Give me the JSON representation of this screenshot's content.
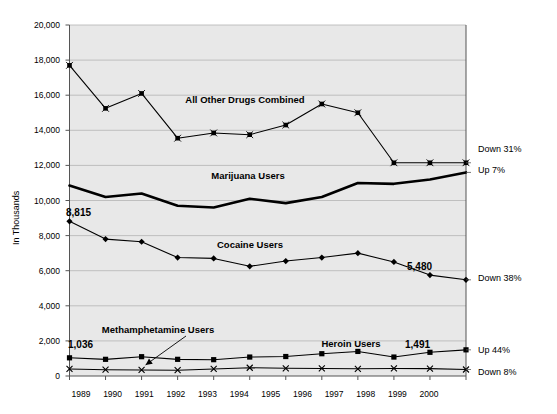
{
  "chart_data": {
    "type": "line",
    "title": "",
    "xlabel": "",
    "ylabel": "In Thousands",
    "grid": true,
    "legend_position": "inline-annotations",
    "categories": [
      "1989",
      "1990",
      "1991",
      "1992",
      "1993",
      "1994",
      "1995",
      "1996",
      "1997",
      "1998",
      "1999",
      "2000"
    ],
    "x": [
      1989,
      1990,
      1991,
      1992,
      1993,
      1994,
      1995,
      1996,
      1997,
      1998,
      1999,
      2000
    ],
    "ylim": [
      0,
      20000
    ],
    "xlim": [
      1989,
      2000
    ],
    "yticks": [
      "0",
      "2,000",
      "4,000",
      "6,000",
      "8,000",
      "10,000",
      "12,000",
      "14,000",
      "16,000",
      "18,000",
      "20,000"
    ],
    "ytick_values": [
      0,
      2000,
      4000,
      6000,
      8000,
      10000,
      12000,
      14000,
      16000,
      18000,
      20000
    ],
    "series": [
      {
        "name": "All Other Drugs Combined",
        "marker": "x-square",
        "values": [
          17700,
          15250,
          16100,
          13550,
          13850,
          13750,
          14300,
          15500,
          15000,
          12150,
          12150,
          12150
        ],
        "end_note": "Down 31%"
      },
      {
        "name": "Marijuana Users",
        "marker": "none",
        "values": [
          10850,
          10200,
          10400,
          9700,
          9600,
          10100,
          9850,
          10200,
          11000,
          10950,
          11200,
          11600
        ],
        "end_note": "Up 7%"
      },
      {
        "name": "Cocaine Users",
        "marker": "diamond",
        "values": [
          8815,
          7800,
          7650,
          6750,
          6700,
          6250,
          6550,
          6750,
          7000,
          6500,
          5750,
          5480
        ],
        "start_label": "8,815",
        "end_label": "5,480",
        "end_note": "Down 38%"
      },
      {
        "name": "Heroin Users",
        "marker": "square",
        "values": [
          1036,
          950,
          1100,
          950,
          930,
          1080,
          1110,
          1270,
          1400,
          1080,
          1350,
          1491
        ],
        "start_label": "1,036",
        "end_label": "1,491",
        "end_note": "Up 44%"
      },
      {
        "name": "Methamphetamine Users",
        "marker": "x",
        "values": [
          400,
          360,
          345,
          330,
          400,
          470,
          440,
          430,
          410,
          430,
          420,
          370
        ],
        "end_note": "Down 8%"
      }
    ],
    "annotations": [
      {
        "text": "All Other Drugs Combined",
        "x": 1993.3,
        "y": 15050
      },
      {
        "text": "Marijuana Users",
        "x": 1993.4,
        "y": 11630
      },
      {
        "text": "Cocaine Users",
        "x": 1994.1,
        "y": 7480
      },
      {
        "text": "Methamphetamine Users",
        "x": 1991.4,
        "y": 2620
      },
      {
        "text": "Heroin Users",
        "x": 1996.4,
        "y": 1800
      }
    ],
    "colors": {
      "plot_background": "#e8e8e8",
      "gridline": "#b4b4b4",
      "axis": "#555555",
      "series_line": "#000000",
      "page_background": "#ffffff"
    }
  },
  "axis": {
    "y_title": "In Thousands"
  },
  "right_notes": [
    {
      "label": "Down 31%",
      "series": "All Other Drugs Combined"
    },
    {
      "label": "Up 7%",
      "series": "Marijuana Users"
    },
    {
      "label": "Down 38%",
      "series": "Cocaine Users"
    },
    {
      "label": "Up 44%",
      "series": "Heroin Users"
    },
    {
      "label": "Down 8%",
      "series": "Methamphetamine Users"
    }
  ],
  "value_labels": [
    {
      "text": "8,815"
    },
    {
      "text": "5,480"
    },
    {
      "text": "1,036"
    },
    {
      "text": "1,491"
    }
  ]
}
